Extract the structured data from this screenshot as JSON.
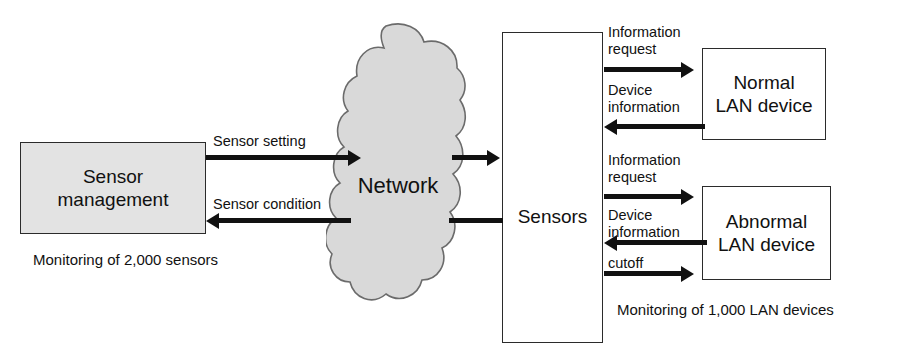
{
  "diagram": {
    "colors": {
      "box_fill": "#e3e3e3",
      "box_border": "#2b2b2b",
      "cloud_fill": "#d9d9d9",
      "cloud_border": "#6b6b6b",
      "arrow": "#111111",
      "background": "#ffffff"
    },
    "nodes": {
      "sensor_management": {
        "label_line1": "Sensor",
        "label_line2": "management"
      },
      "network": {
        "label": "Network"
      },
      "sensors": {
        "label": "Sensors"
      },
      "normal_device": {
        "label_line1": "Normal",
        "label_line2": "LAN device"
      },
      "abnormal_device": {
        "label_line1": "Abnormal",
        "label_line2": "LAN device"
      }
    },
    "edges": {
      "sensor_setting": "Sensor setting",
      "sensor_condition": "Sensor condition",
      "normal_info_request_line1": "Information",
      "normal_info_request_line2": "request",
      "normal_device_info_line1": "Device",
      "normal_device_info_line2": "information",
      "abnormal_info_request_line1": "Information",
      "abnormal_info_request_line2": "request",
      "abnormal_device_info_line1": "Device",
      "abnormal_device_info_line2": "information",
      "cutoff": "cutoff"
    },
    "captions": {
      "sensors_monitoring": "Monitoring of 2,000 sensors",
      "lan_monitoring": "Monitoring of 1,000 LAN devices"
    }
  }
}
